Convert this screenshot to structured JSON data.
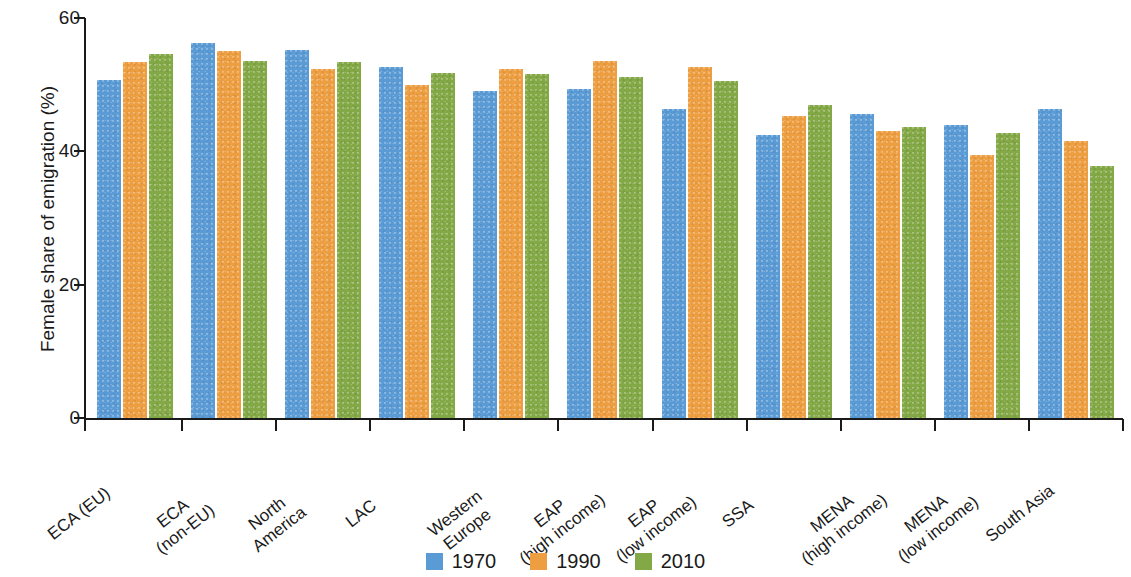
{
  "chart_data": {
    "type": "bar",
    "title": "",
    "subtitle": "",
    "xlabel": "",
    "ylabel": "Female share of emigration (%)",
    "ylim": [
      0,
      60
    ],
    "yticks": [
      0,
      20,
      40,
      60
    ],
    "ytick_labels": [
      "0",
      "20",
      "40",
      "60"
    ],
    "grid": false,
    "legend_position": "bottom-center",
    "categories": [
      "ECA (EU)",
      "ECA\n(non-EU)",
      "North\nAmerica",
      "LAC",
      "Western\nEurope",
      "EAP\n(high income)",
      "EAP\n(low income)",
      "SSA",
      "MENA\n(high income)",
      "MENA\n(low income)",
      "South Asia"
    ],
    "series": [
      {
        "name": "1970",
        "color": "#5b9bd5",
        "values": [
          50.7,
          56.3,
          55.2,
          52.6,
          49.1,
          49.3,
          46.4,
          42.4,
          45.6,
          44.0,
          46.4
        ]
      },
      {
        "name": "1990",
        "color": "#ed9e41",
        "values": [
          53.4,
          55.0,
          52.4,
          49.9,
          52.4,
          53.6,
          52.7,
          45.3,
          43.1,
          39.4,
          41.5
        ]
      },
      {
        "name": "2010",
        "color": "#83a846",
        "values": [
          54.6,
          53.5,
          53.4,
          51.8,
          51.6,
          51.1,
          50.6,
          47.0,
          43.7,
          42.7,
          37.8
        ]
      }
    ]
  },
  "legend": {
    "items": [
      {
        "label": "1970",
        "color": "#5b9bd5"
      },
      {
        "label": "1990",
        "color": "#ed9e41"
      },
      {
        "label": "2010",
        "color": "#83a846"
      }
    ]
  }
}
